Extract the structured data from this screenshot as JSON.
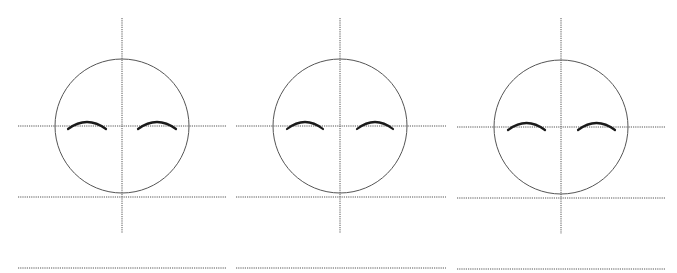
{
  "figure": {
    "colors": {
      "background": "#ffffff",
      "guide_line": "#555555",
      "head_outline": "#555555",
      "eyebrow": "#1a1a1a"
    },
    "panels": [
      {
        "id": "panel-1",
        "circle": {
          "cx": 122,
          "cy": 126,
          "r": 67
        },
        "vertical_guide": {
          "x": 122,
          "y1": 18,
          "y2": 233
        },
        "horizontal_guides": [
          {
            "y": 126,
            "x1": 18,
            "x2": 226
          },
          {
            "y": 197,
            "x1": 18,
            "x2": 226
          },
          {
            "y": 268,
            "x1": 18,
            "x2": 226
          }
        ],
        "eyebrows": [
          {
            "x1": 68,
            "x2": 106,
            "base_y": 129,
            "peak_y": 122
          },
          {
            "x1": 138,
            "x2": 176,
            "base_y": 129,
            "peak_y": 122
          }
        ]
      },
      {
        "id": "panel-2",
        "circle": {
          "cx": 340,
          "cy": 126,
          "r": 67
        },
        "vertical_guide": {
          "x": 340,
          "y1": 18,
          "y2": 233
        },
        "horizontal_guides": [
          {
            "y": 126,
            "x1": 236,
            "x2": 446
          },
          {
            "y": 197,
            "x1": 236,
            "x2": 446
          },
          {
            "y": 268,
            "x1": 236,
            "x2": 446
          }
        ],
        "eyebrows": [
          {
            "x1": 287,
            "x2": 323,
            "base_y": 129,
            "peak_y": 122
          },
          {
            "x1": 357,
            "x2": 393,
            "base_y": 129,
            "peak_y": 122
          }
        ]
      },
      {
        "id": "panel-3",
        "circle": {
          "cx": 561,
          "cy": 127,
          "r": 67
        },
        "vertical_guide": {
          "x": 561,
          "y1": 18,
          "y2": 234
        },
        "horizontal_guides": [
          {
            "y": 127,
            "x1": 457,
            "x2": 666
          },
          {
            "y": 198,
            "x1": 457,
            "x2": 666
          },
          {
            "y": 269,
            "x1": 457,
            "x2": 666
          }
        ],
        "eyebrows": [
          {
            "x1": 508,
            "x2": 545,
            "base_y": 130,
            "peak_y": 123
          },
          {
            "x1": 578,
            "x2": 615,
            "base_y": 130,
            "peak_y": 123
          }
        ]
      }
    ]
  }
}
